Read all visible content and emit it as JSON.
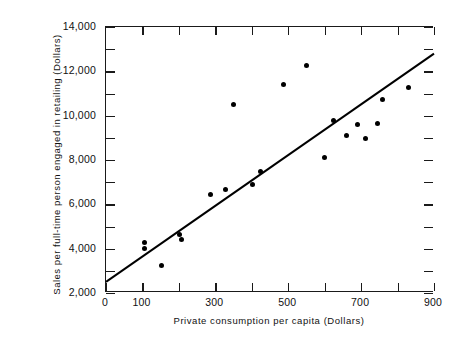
{
  "chart_data": {
    "type": "scatter",
    "title": "",
    "xlabel": "Private consumption per capita (Dollars)",
    "ylabel": "Sales per full-time person engaged in retailing (Dollars)",
    "xlim": [
      0,
      900
    ],
    "ylim": [
      2000,
      14000
    ],
    "grid": false,
    "legend": null,
    "x_major_ticks": [
      0,
      100,
      300,
      500,
      700,
      900
    ],
    "x_minor_ticks": [
      200,
      400,
      600,
      800
    ],
    "x_tick_labels": [
      "0",
      "100",
      "300",
      "500",
      "700",
      "900"
    ],
    "y_major_ticks": [
      2000,
      4000,
      6000,
      8000,
      10000,
      12000,
      14000
    ],
    "y_minor_ticks": [
      3000,
      5000,
      7000,
      9000,
      11000,
      13000
    ],
    "y_tick_labels": [
      "2,000",
      "4,000",
      "6,000",
      "8,000",
      "10,000",
      "12,000",
      "14,000"
    ],
    "points": [
      {
        "x": 152,
        "y": 3250
      },
      {
        "x": 107,
        "y": 4300
      },
      {
        "x": 107,
        "y": 4000
      },
      {
        "x": 201,
        "y": 4650
      },
      {
        "x": 206,
        "y": 4400
      },
      {
        "x": 288,
        "y": 6450
      },
      {
        "x": 327,
        "y": 6650
      },
      {
        "x": 350,
        "y": 10500
      },
      {
        "x": 403,
        "y": 6900
      },
      {
        "x": 425,
        "y": 7500
      },
      {
        "x": 486,
        "y": 11400
      },
      {
        "x": 550,
        "y": 12250
      },
      {
        "x": 600,
        "y": 8100
      },
      {
        "x": 625,
        "y": 9800
      },
      {
        "x": 660,
        "y": 9100
      },
      {
        "x": 690,
        "y": 9600
      },
      {
        "x": 712,
        "y": 8950
      },
      {
        "x": 745,
        "y": 9650
      },
      {
        "x": 760,
        "y": 10750
      },
      {
        "x": 830,
        "y": 11250
      }
    ],
    "fit_line": {
      "type": "linear-regression",
      "x_start": 0,
      "y_start": 2500,
      "x_end": 900,
      "y_end": 12800
    }
  }
}
